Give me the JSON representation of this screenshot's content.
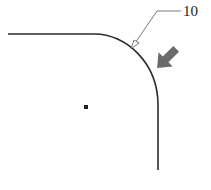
{
  "figure": {
    "reference_numerals": [
      {
        "id": "10",
        "text": "10"
      }
    ],
    "colors": {
      "outline": "#2a2a2a",
      "leader": "#555555",
      "arrow": "#6b6b6b",
      "dot": "#222222"
    }
  }
}
